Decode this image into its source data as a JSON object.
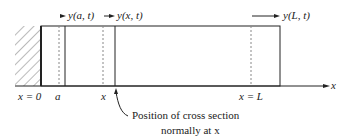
{
  "diagram": {
    "top_labels": {
      "y_a_t": "y(a, t)",
      "y_x_t": "y(x, t)",
      "y_L_t": "y(L, t)"
    },
    "axis_labels": {
      "x0": "x = 0",
      "a": "a",
      "x": "x",
      "xL": "x = L",
      "axis": "x"
    },
    "annotation": {
      "line1": "Position of cross section",
      "line2": "normally at x"
    },
    "colors": {
      "stroke": "#222222",
      "dashed": "#888888",
      "hatch": "#777777"
    }
  }
}
